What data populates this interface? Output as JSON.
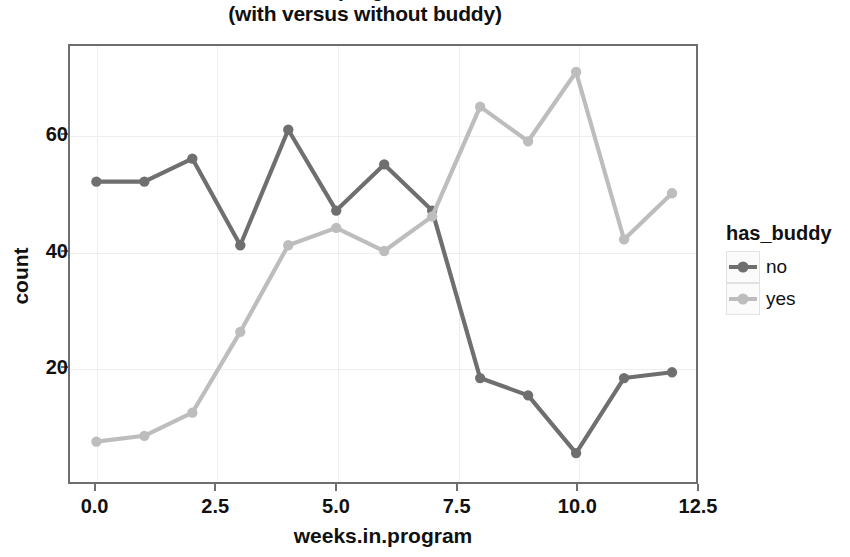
{
  "chart_data": {
    "type": "line",
    "title": "weeks in program count",
    "subtitle": "(with versus without buddy)",
    "xlabel": "weeks.in.program",
    "ylabel": "count",
    "x": [
      0,
      1,
      2,
      3,
      4,
      5,
      6,
      7,
      8,
      9,
      10,
      11,
      12
    ],
    "series": [
      {
        "name": "no",
        "color": "#6f6f6f",
        "values": [
          52,
          52,
          56,
          41,
          61,
          47,
          55,
          47,
          18,
          15,
          5,
          18,
          19
        ]
      },
      {
        "name": "yes",
        "color": "#bdbdbd",
        "values": [
          7,
          8,
          12,
          26,
          41,
          44,
          40,
          46,
          65,
          59,
          71,
          42,
          50
        ]
      }
    ],
    "xlim": [
      -0.55,
      12.5
    ],
    "ylim": [
      0,
      75.5
    ],
    "xticks": [
      0,
      2.5,
      5,
      7.5,
      10,
      12.5
    ],
    "xticklabels": [
      "0.0",
      "2.5",
      "5.0",
      "7.5",
      "10.0",
      "12.5"
    ],
    "yticks": [
      20,
      40,
      60
    ],
    "yticklabels": [
      "20",
      "40",
      "60"
    ],
    "grid": true,
    "legend": {
      "title": "has_buddy",
      "position": "right",
      "entries": [
        "no",
        "yes"
      ]
    },
    "marker": "circle",
    "panel_border_color": "#6e6e6e",
    "grid_color": "#eeeeee",
    "background": "#ffffff"
  }
}
